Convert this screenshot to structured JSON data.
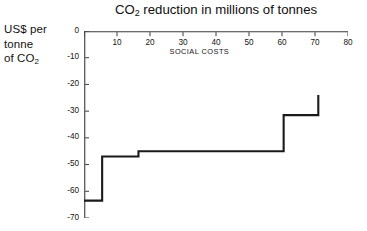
{
  "chart_data": {
    "type": "line",
    "subtype": "step-post",
    "title": "CO2 reduction in millions of tonnes",
    "title_parts": {
      "pre": "CO",
      "sub": "2",
      "post": " reduction in millions of tonnes"
    },
    "xlabel": "",
    "ylabel": "US$ per tonne of CO2",
    "ylabel_lines": [
      {
        "pre": "US$ per",
        "sub": "",
        "post": ""
      },
      {
        "pre": "tonne",
        "sub": "",
        "post": ""
      },
      {
        "pre": "of CO",
        "sub": "2",
        "post": ""
      }
    ],
    "xlim": [
      0,
      80
    ],
    "ylim": [
      -70,
      0
    ],
    "x_axis_position": "top",
    "xticks": [
      0,
      10,
      20,
      30,
      40,
      50,
      60,
      70,
      80
    ],
    "xtick_labels": [
      "0",
      "10",
      "20",
      "30",
      "40",
      "50",
      "60",
      "70",
      "80"
    ],
    "xtick_label_shown": [
      false,
      true,
      true,
      true,
      true,
      true,
      true,
      true,
      true
    ],
    "yticks": [
      0,
      -10,
      -20,
      -30,
      -40,
      -50,
      -60,
      -70
    ],
    "ytick_labels": [
      "0",
      "-10",
      "-20",
      "-30",
      "-40",
      "-50",
      "-60",
      "-70"
    ],
    "grid": false,
    "legend": null,
    "legend_position": "none",
    "line_color": "#1a1a1a",
    "line_width": 2.1,
    "series": [
      {
        "name": "Marginal abatement cost",
        "steps": [
          {
            "x_start": 0.0,
            "x_end": 5.5,
            "y": -63.5
          },
          {
            "x_start": 5.5,
            "x_end": 16.5,
            "y": -47.0
          },
          {
            "x_start": 16.5,
            "x_end": 60.5,
            "y": -45.0
          },
          {
            "x_start": 60.5,
            "x_end": 71.0,
            "y": -31.5
          }
        ],
        "terminal_riser": {
          "x": 71.0,
          "y_from": -31.5,
          "y_to": -24.0
        },
        "x": [
          0,
          5.5,
          5.5,
          16.5,
          16.5,
          60.5,
          60.5,
          71,
          71
        ],
        "y": [
          -63.5,
          -63.5,
          -47,
          -47,
          -45,
          -45,
          -31.5,
          -31.5,
          -24
        ]
      }
    ],
    "annotations": [
      {
        "text": "SOCIAL COSTS",
        "x": 35,
        "y": -8
      }
    ]
  },
  "figure": {
    "background_color": "#ffffff",
    "axis_color": "#3a3a3a"
  }
}
